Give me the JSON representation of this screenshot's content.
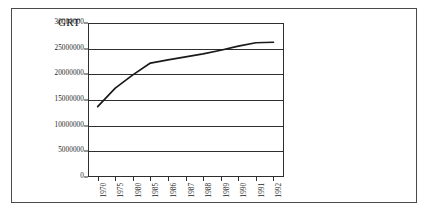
{
  "figure": {
    "axis_title": "GRT",
    "frame_color": "#4a4a4a",
    "background": "#ffffff"
  },
  "chart_data": {
    "type": "line",
    "title": "GRT",
    "xlabel": "",
    "ylabel": "GRT",
    "grid": true,
    "legend": "none",
    "line_color": "#1a1a1a",
    "categories": [
      "1970",
      "1975",
      "1980",
      "1985",
      "1986",
      "1987",
      "1988",
      "1989",
      "1990",
      "1991",
      "1992"
    ],
    "values": [
      13700000,
      17300000,
      19900000,
      22200000,
      22800000,
      23400000,
      24000000,
      24700000,
      25500000,
      26150000,
      26250000
    ],
    "ylim": [
      0,
      30000000
    ],
    "ytick_values": [
      0,
      5000000,
      10000000,
      15000000,
      20000000,
      25000000,
      30000000
    ],
    "ytick_labels": [
      "0",
      "5000000",
      "10000000",
      "15000000",
      "20000000",
      "25000000",
      "30000000"
    ],
    "xtick_labels": [
      "1970",
      "1975",
      "1980",
      "1985",
      "1986",
      "1987",
      "1988",
      "1989",
      "1990",
      "1991",
      "1992"
    ]
  }
}
